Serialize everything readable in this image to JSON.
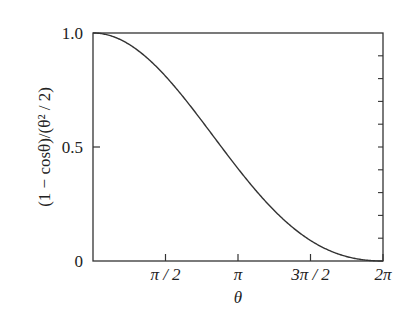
{
  "chart_data": {
    "type": "line",
    "title": "",
    "xlabel": "θ",
    "ylabel": "(1 − cosθ)/(θ² / 2)",
    "xlim": [
      0,
      6.2832
    ],
    "ylim": [
      0,
      1.0
    ],
    "grid": false,
    "legend": null,
    "x_ticks": [
      {
        "value": 1.5708,
        "label": "π / 2"
      },
      {
        "value": 3.1416,
        "label": "π"
      },
      {
        "value": 4.7124,
        "label": "3π / 2"
      },
      {
        "value": 6.2832,
        "label": "2π"
      }
    ],
    "y_ticks": [
      {
        "value": 0,
        "label": "0"
      },
      {
        "value": 0.5,
        "label": "0.5"
      },
      {
        "value": 1.0,
        "label": "1.0"
      }
    ],
    "right_axis_minor_ticks": [
      0.1,
      0.2,
      0.3,
      0.4,
      0.5,
      0.6,
      0.7,
      0.8,
      0.9
    ],
    "series": [
      {
        "name": "(1 − cosθ)/(θ²/2)",
        "function": "(1-cos(x))/(x*x/2)",
        "x": [
          0,
          0.7854,
          1.5708,
          2.3562,
          3.1416,
          3.927,
          4.7124,
          5.4978,
          6.2832
        ],
        "values": [
          1.0,
          0.9496,
          0.8106,
          0.615,
          0.4053,
          0.2212,
          0.0901,
          0.0194,
          0.0
        ]
      }
    ],
    "line_color": "#333333"
  }
}
